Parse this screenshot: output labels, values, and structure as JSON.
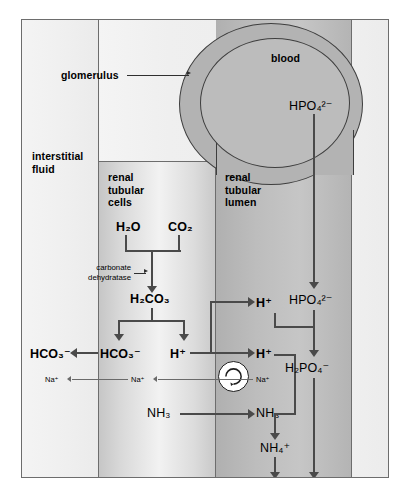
{
  "figure": {
    "compartments": {
      "interstitial_fluid": "interstitial\nfluid",
      "renal_tubular_cells": "renal\ntubular\ncells",
      "renal_tubular_lumen": "renal\ntubular\nlumen",
      "blood": "blood",
      "glomerulus": "glomerulus"
    },
    "enzyme": "carbonate\ndehydratase",
    "species": {
      "water": "H₂O",
      "carbon_dioxide": "CO₂",
      "carbonic_acid": "H₂CO₃",
      "bicarbonate_cell": "HCO₃⁻",
      "bicarbonate_interstitial": "HCO₃⁻",
      "proton_cell": "H⁺",
      "proton_lumen": "H⁺",
      "proton_lumen_upper": "H⁺",
      "sodium_interstitial": "Na⁺",
      "sodium_cell": "Na⁺",
      "sodium_lumen": "Na⁺",
      "ammonia_cell": "NH₃",
      "ammonia_lumen": "NH₃",
      "ammonium": "NH₄⁺",
      "hydrogen_phosphate_blood": "HPO₄²⁻",
      "hydrogen_phosphate_lumen": "HPO₄²⁻",
      "dihydrogen_phosphate": "H₂PO₄⁻"
    },
    "colors": {
      "frame_border": "#6d6d6d",
      "blood": "#bcbcbc",
      "capsule": "#b3b3b3",
      "lumen_band": "#bdbdbd",
      "cell_band": "#e0e0e0",
      "interstitial_band": "#f1f1f1",
      "arrow": "#4a4a4a",
      "thin_arrow": "#6a6a6a",
      "transporter_fill": "#ffffff",
      "transporter_stroke": "#1f1f1f"
    }
  }
}
